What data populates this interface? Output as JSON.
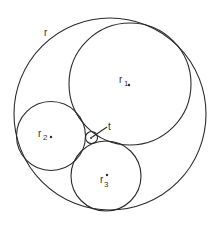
{
  "diagram": {
    "stroke_color": "#2a2a2a",
    "circles": [
      {
        "name": "outer",
        "label": "r",
        "sub": ""
      },
      {
        "name": "c1",
        "label": "r",
        "sub": "1"
      },
      {
        "name": "c2",
        "label": "r",
        "sub": "2"
      },
      {
        "name": "c3",
        "label": "r",
        "sub": "3"
      },
      {
        "name": "inner",
        "label": "t",
        "sub": ""
      }
    ]
  }
}
